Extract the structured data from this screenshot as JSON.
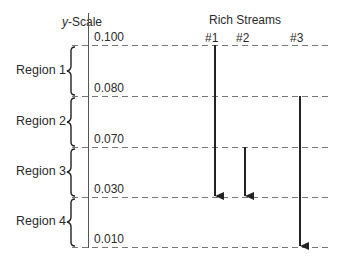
{
  "diagram": {
    "axis_title_italic": "y",
    "axis_title_rest": "-Scale",
    "streams_title": "Rich Streams",
    "scale_values": [
      {
        "label": "0.100",
        "y": 45
      },
      {
        "label": "0.080",
        "y": 96
      },
      {
        "label": "0.070",
        "y": 147
      },
      {
        "label": "0.030",
        "y": 197
      },
      {
        "label": "0.010",
        "y": 247
      }
    ],
    "regions": [
      {
        "label": "Region 1",
        "y_top": 45,
        "y_bottom": 96
      },
      {
        "label": "Region 2",
        "y_top": 96,
        "y_bottom": 147
      },
      {
        "label": "Region 3",
        "y_top": 147,
        "y_bottom": 197
      },
      {
        "label": "Region 4",
        "y_top": 197,
        "y_bottom": 247
      }
    ],
    "streams": [
      {
        "label": "#1",
        "x": 215,
        "from": "0.100",
        "to": "0.030",
        "y_start": 45,
        "y_end": 197
      },
      {
        "label": "#2",
        "x": 245,
        "from": "0.070",
        "to": "0.030",
        "y_start": 147,
        "y_end": 197
      },
      {
        "label": "#3",
        "x": 300,
        "from": "0.080",
        "to": "0.010",
        "y_start": 96,
        "y_end": 247
      }
    ],
    "colors": {
      "line": "#222222",
      "dashed": "#777777",
      "text": "#2a2a2a"
    }
  }
}
